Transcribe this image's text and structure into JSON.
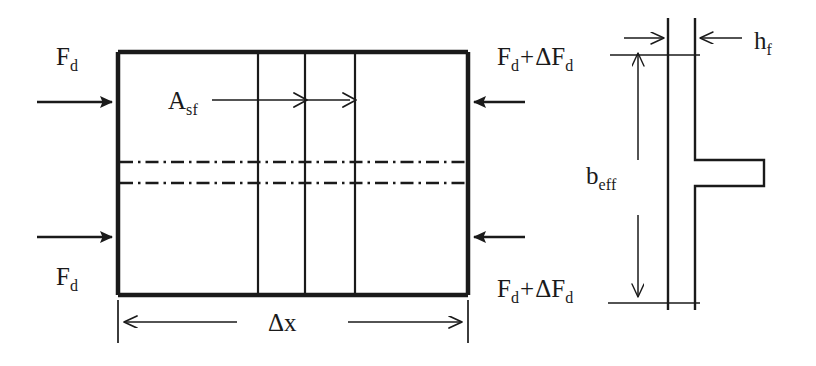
{
  "figure": {
    "width": 816,
    "height": 366,
    "background_color": "#ffffff",
    "line_color": "#1a1a1a",
    "thick_stroke": 4,
    "thin_stroke": 1.6
  },
  "labels": {
    "force_left_top": {
      "base": "F",
      "sub": "d"
    },
    "force_left_bottom": {
      "base": "F",
      "sub": "d"
    },
    "force_right_top": {
      "base": "F",
      "sub": "d",
      "op": "+",
      "delta": "ΔF",
      "delta_sub": "d"
    },
    "force_right_bottom": {
      "base": "F",
      "sub": "d",
      "op": "+",
      "delta": "ΔF",
      "delta_sub": "d"
    },
    "area_shear_flange": {
      "base": "A",
      "sub": "sf"
    },
    "length_increment": {
      "base": "Δx",
      "sub": ""
    },
    "effective_width": {
      "base": "b",
      "sub": "eff"
    },
    "flange_thickness": {
      "base": "h",
      "sub": "f"
    }
  },
  "label_text": {
    "force_left_top": "F_d",
    "force_left_bottom": "F_d",
    "force_right_top": "F_d + ΔF_d",
    "force_right_bottom": "F_d + ΔF_d",
    "area_shear_flange": "A_sf",
    "length_increment": "Δx",
    "effective_width": "b_eff",
    "flange_thickness": "h_f"
  },
  "geometry": {
    "flange_block": {
      "left": 118,
      "top": 52,
      "right": 468,
      "bottom": 295,
      "internal_vertical_lines_x": [
        258,
        305,
        355
      ]
    },
    "centerlines_y": [
      162,
      183
    ],
    "force_arrows": [
      {
        "name": "left-top",
        "x1": 37,
        "y1": 102,
        "x2": 118,
        "y2": 102,
        "direction": "right"
      },
      {
        "name": "left-bottom",
        "x1": 37,
        "y1": 237,
        "x2": 118,
        "y2": 237,
        "direction": "right"
      },
      {
        "name": "right-top",
        "x1": 525,
        "y1": 102,
        "x2": 468,
        "y2": 102,
        "direction": "left"
      },
      {
        "name": "right-bottom",
        "x1": 525,
        "y1": 237,
        "x2": 468,
        "y2": 237,
        "direction": "left"
      }
    ],
    "shear_leader": {
      "x1": 212,
      "y1": 100,
      "x2": 355,
      "y2": 100,
      "arrow_tips_x": [
        305,
        355
      ]
    },
    "dim_delta_x": {
      "y": 322,
      "left_tick_x": 118,
      "right_tick_x": 468
    },
    "tee_section": {
      "flange_left_x": 668,
      "flange_right_x": 695,
      "top_y": 18,
      "bottom_y": 310,
      "web_top_y": 160,
      "web_bottom_y": 186,
      "web_tip_x": 764
    },
    "dim_h_f": {
      "y": 38,
      "left_arrow_from": 624,
      "right_arrow_from": 740
    },
    "dim_b_eff": {
      "x": 638,
      "top_y": 47,
      "bottom_y": 302
    }
  },
  "icons": {
    "arrow_solid": "solid-arrowhead",
    "arrow_open": "open-arrowhead",
    "centerline": "dash-dot-line"
  }
}
